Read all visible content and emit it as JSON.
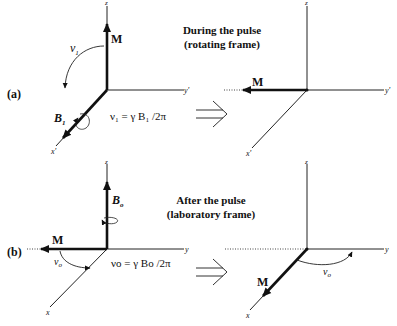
{
  "panel_a": {
    "label": "(a)",
    "title_line1": "During the pulse",
    "title_line2": "(rotating frame)",
    "left": {
      "axis_z": "z",
      "axis_y": "y'",
      "axis_x": "x'",
      "vector_M": "M",
      "nu_label": "ν",
      "nu_sub": "1",
      "field_label": "B",
      "field_sub": "1",
      "equation": "ν₁ = γ B₁ /2π"
    },
    "right": {
      "axis_z": "z",
      "axis_y": "y'",
      "axis_x": "x'",
      "vector_M": "M"
    }
  },
  "panel_b": {
    "label": "(b)",
    "title_line1": "After the pulse",
    "title_line2": "(laboratory frame)",
    "left": {
      "axis_z": "z",
      "axis_y": "y",
      "axis_x": "x",
      "vector_M": "M",
      "field_label": "B",
      "field_sub": "o",
      "nu_label": "ν",
      "nu_sub": "o",
      "equation": "νo = γ Bo /2π"
    },
    "right": {
      "axis_z": "z",
      "axis_y": "y",
      "axis_x": "x",
      "vector_M": "M",
      "nu_label": "ν",
      "nu_sub": "o"
    }
  },
  "transition_arrow": "⇒",
  "colors": {
    "ink": "#111111",
    "background": "#ffffff"
  }
}
